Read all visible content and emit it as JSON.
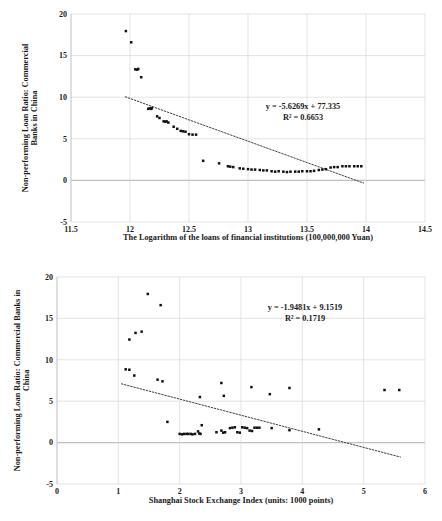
{
  "figure": {
    "background": "#ffffff",
    "marker_color": "#111111",
    "grid_color": "#d9d9d9",
    "axis_color": "#bfbfbf",
    "trend_color": "#404040",
    "caption_partial": " "
  },
  "chart_data": [
    {
      "id": "top",
      "type": "scatter",
      "title": "",
      "xlabel": "The Logarithm of the loans of financial institutions (100,000,000 Yuan)",
      "ylabel": "Non-performing Loan Ratio: Commercial Banks in China",
      "xlim": [
        11.5,
        14.5
      ],
      "ylim": [
        -5,
        20
      ],
      "xticks": [
        "11.5",
        "12",
        "12.5",
        "13",
        "13.5",
        "14",
        "14.5"
      ],
      "yticks": [
        "20",
        "15",
        "10",
        "5",
        "0",
        "-5"
      ],
      "grid": true,
      "legend": "none",
      "annotation": {
        "equation": "y = -5.6269x + 77.335",
        "r2": "R² = 0.6653",
        "slope": -5.6269,
        "intercept": 77.335,
        "r_squared": 0.6653
      },
      "trendline": {
        "x0": 11.96,
        "y0": 10.05,
        "x1": 13.98,
        "y1": -0.32
      },
      "points": [
        [
          11.965,
          17.95
        ],
        [
          12.01,
          16.6
        ],
        [
          12.045,
          13.35
        ],
        [
          12.06,
          13.3
        ],
        [
          12.07,
          13.4
        ],
        [
          12.095,
          12.4
        ],
        [
          12.155,
          8.6
        ],
        [
          12.165,
          8.65
        ],
        [
          12.18,
          8.6
        ],
        [
          12.185,
          8.7
        ],
        [
          12.23,
          7.7
        ],
        [
          12.25,
          7.5
        ],
        [
          12.285,
          7.1
        ],
        [
          12.3,
          7.05
        ],
        [
          12.31,
          7.1
        ],
        [
          12.325,
          6.95
        ],
        [
          12.37,
          6.45
        ],
        [
          12.4,
          6.2
        ],
        [
          12.43,
          5.95
        ],
        [
          12.45,
          5.9
        ],
        [
          12.47,
          5.85
        ],
        [
          12.5,
          5.55
        ],
        [
          12.53,
          5.5
        ],
        [
          12.56,
          5.5
        ],
        [
          12.62,
          2.35
        ],
        [
          12.755,
          2.05
        ],
        [
          12.83,
          1.7
        ],
        [
          12.85,
          1.65
        ],
        [
          12.875,
          1.6
        ],
        [
          12.93,
          1.45
        ],
        [
          12.96,
          1.4
        ],
        [
          13.0,
          1.35
        ],
        [
          13.03,
          1.3
        ],
        [
          13.06,
          1.3
        ],
        [
          13.1,
          1.25
        ],
        [
          13.13,
          1.2
        ],
        [
          13.16,
          1.2
        ],
        [
          13.2,
          1.1
        ],
        [
          13.23,
          1.05
        ],
        [
          13.26,
          1.1
        ],
        [
          13.3,
          1.05
        ],
        [
          13.33,
          1.0
        ],
        [
          13.36,
          1.05
        ],
        [
          13.4,
          1.05
        ],
        [
          13.43,
          1.05
        ],
        [
          13.46,
          1.1
        ],
        [
          13.5,
          1.1
        ],
        [
          13.53,
          1.1
        ],
        [
          13.56,
          1.15
        ],
        [
          13.6,
          1.25
        ],
        [
          13.63,
          1.3
        ],
        [
          13.66,
          1.35
        ],
        [
          13.7,
          1.55
        ],
        [
          13.73,
          1.6
        ],
        [
          13.76,
          1.6
        ],
        [
          13.8,
          1.7
        ],
        [
          13.83,
          1.7
        ],
        [
          13.86,
          1.7
        ],
        [
          13.9,
          1.7
        ],
        [
          13.93,
          1.7
        ],
        [
          13.96,
          1.7
        ]
      ]
    },
    {
      "id": "bottom",
      "type": "scatter",
      "title": "",
      "xlabel": "Shanghai Stock Exchange Index (units: 1000 points)",
      "ylabel": "Non-performing Loan Ratio: Commercial Banks in China",
      "xlim": [
        0,
        6
      ],
      "ylim": [
        -5,
        20
      ],
      "xticks": [
        "0",
        "1",
        "2",
        "3",
        "4",
        "5",
        "6"
      ],
      "yticks": [
        "20",
        "15",
        "10",
        "5",
        "0",
        "-5"
      ],
      "grid": true,
      "legend": "none",
      "annotation": {
        "equation": "y = -1.9481x + 9.1519",
        "r2": "R² = 0.1719",
        "slope": -1.9481,
        "intercept": 9.1519,
        "r_squared": 0.1719
      },
      "trendline": {
        "x0": 1.05,
        "y0": 7.1,
        "x1": 5.6,
        "y1": -1.75
      },
      "points": [
        [
          1.48,
          17.95
        ],
        [
          1.69,
          16.6
        ],
        [
          1.18,
          12.45
        ],
        [
          1.28,
          13.25
        ],
        [
          1.38,
          13.4
        ],
        [
          1.12,
          8.85
        ],
        [
          1.18,
          8.8
        ],
        [
          1.26,
          8.1
        ],
        [
          1.64,
          7.6
        ],
        [
          1.72,
          7.4
        ],
        [
          2.68,
          7.2
        ],
        [
          3.17,
          6.7
        ],
        [
          3.79,
          6.6
        ],
        [
          5.34,
          6.35
        ],
        [
          5.58,
          6.35
        ],
        [
          3.47,
          5.85
        ],
        [
          2.72,
          5.65
        ],
        [
          2.33,
          5.5
        ],
        [
          1.8,
          2.5
        ],
        [
          2.36,
          2.1
        ],
        [
          2.0,
          1.05
        ],
        [
          2.04,
          1.0
        ],
        [
          2.07,
          1.05
        ],
        [
          2.11,
          1.05
        ],
        [
          2.14,
          1.05
        ],
        [
          2.18,
          1.05
        ],
        [
          2.21,
          1.0
        ],
        [
          2.25,
          1.05
        ],
        [
          2.3,
          1.35
        ],
        [
          2.32,
          1.1
        ],
        [
          2.34,
          1.05
        ],
        [
          2.6,
          1.25
        ],
        [
          2.68,
          1.45
        ],
        [
          2.71,
          1.2
        ],
        [
          2.74,
          1.25
        ],
        [
          2.82,
          1.75
        ],
        [
          2.86,
          1.8
        ],
        [
          2.9,
          1.85
        ],
        [
          2.94,
          1.25
        ],
        [
          2.98,
          1.2
        ],
        [
          3.02,
          1.85
        ],
        [
          3.06,
          1.8
        ],
        [
          3.1,
          1.75
        ],
        [
          3.14,
          1.45
        ],
        [
          3.18,
          1.4
        ],
        [
          3.22,
          1.8
        ],
        [
          3.26,
          1.8
        ],
        [
          3.3,
          1.8
        ],
        [
          3.5,
          1.75
        ],
        [
          3.79,
          1.5
        ],
        [
          4.27,
          1.6
        ]
      ]
    }
  ]
}
